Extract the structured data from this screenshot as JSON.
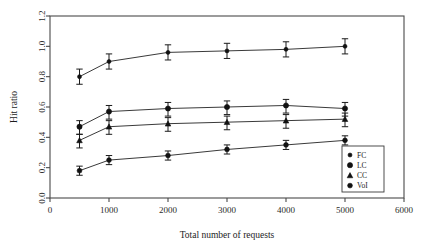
{
  "chart_data": {
    "type": "line",
    "title": "",
    "xlabel": "Total number of requests",
    "ylabel": "Hit ratio",
    "xlim": [
      0,
      6000
    ],
    "ylim": [
      0.0,
      1.2
    ],
    "xticks": [
      0,
      1000,
      2000,
      3000,
      4000,
      5000,
      6000
    ],
    "xticklabels": [
      "0",
      "1000",
      "2000",
      "3000",
      "4000",
      "5000",
      "6000"
    ],
    "yticks": [
      0.0,
      0.2,
      0.4,
      0.6,
      0.8,
      1.0,
      1.2
    ],
    "yticklabels": [
      "0.0",
      "0.2",
      "0.4",
      "0.6",
      "0.8",
      "1.0",
      "1.2"
    ],
    "grid": false,
    "legend_position": "bottom-right",
    "x": [
      500,
      1000,
      2000,
      3000,
      4000,
      5000
    ],
    "series": [
      {
        "name": "FC",
        "marker": "small-filled-circle",
        "values": [
          0.8,
          0.9,
          0.96,
          0.97,
          0.98,
          1.0
        ],
        "err_low": [
          0.05,
          0.05,
          0.05,
          0.05,
          0.05,
          0.05
        ],
        "err_high": [
          0.05,
          0.05,
          0.05,
          0.05,
          0.05,
          0.05
        ]
      },
      {
        "name": "LC",
        "marker": "filled-circle",
        "values": [
          0.47,
          0.57,
          0.59,
          0.6,
          0.61,
          0.59
        ],
        "err_low": [
          0.05,
          0.05,
          0.05,
          0.05,
          0.05,
          0.05
        ],
        "err_high": [
          0.04,
          0.04,
          0.04,
          0.04,
          0.04,
          0.04
        ]
      },
      {
        "name": "CC",
        "marker": "triangle",
        "values": [
          0.38,
          0.47,
          0.49,
          0.5,
          0.51,
          0.52
        ],
        "err_low": [
          0.05,
          0.05,
          0.05,
          0.05,
          0.05,
          0.05
        ],
        "err_high": [
          0.04,
          0.04,
          0.04,
          0.04,
          0.04,
          0.04
        ]
      },
      {
        "name": "VoI",
        "marker": "open-circle",
        "values": [
          0.18,
          0.25,
          0.28,
          0.32,
          0.35,
          0.38
        ],
        "err_low": [
          0.03,
          0.03,
          0.03,
          0.03,
          0.03,
          0.03
        ],
        "err_high": [
          0.03,
          0.03,
          0.03,
          0.03,
          0.03,
          0.03
        ]
      }
    ],
    "legend": [
      {
        "label": "FC",
        "marker": "small-filled-circle"
      },
      {
        "label": "LC",
        "marker": "filled-circle"
      },
      {
        "label": "CC",
        "marker": "triangle"
      },
      {
        "label": "VoI",
        "marker": "open-circle"
      }
    ],
    "colors": {
      "line": "#3a3a3a",
      "marker": "#111111",
      "axis": "#4a4a4a",
      "text": "#1c1c1c",
      "background": "#ffffff"
    }
  }
}
